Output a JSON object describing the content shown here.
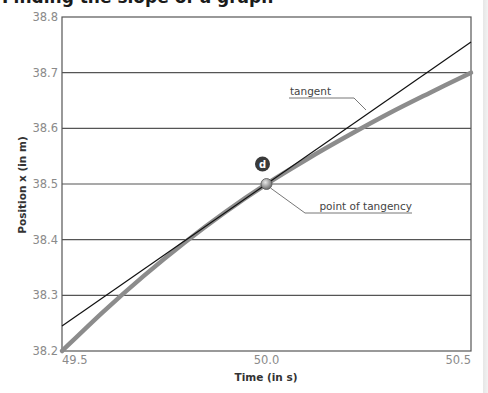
{
  "page": {
    "title": "Finding the slope of a graph"
  },
  "chart_data": {
    "type": "line",
    "title": "",
    "xlabel": "Time (in s)",
    "ylabel": "Position x (in m)",
    "xlim": [
      49.5,
      50.5
    ],
    "ylim": [
      38.2,
      38.8
    ],
    "xticks": [
      49.5,
      50.0,
      50.5
    ],
    "xtick_labels": [
      "49.5",
      "50.0",
      "50.5"
    ],
    "yticks": [
      38.2,
      38.3,
      38.4,
      38.5,
      38.6,
      38.7,
      38.8
    ],
    "ytick_labels": [
      "38.2",
      "38.3",
      "38.4",
      "38.5",
      "38.6",
      "38.7",
      "38.8"
    ],
    "grid": "horizontal",
    "series": [
      {
        "name": "position curve",
        "color": "#8c8c8c",
        "x": [
          49.5,
          49.6,
          49.7,
          49.8,
          49.9,
          50.0,
          50.1,
          50.2,
          50.3,
          50.4,
          50.5
        ],
        "y": [
          38.2,
          38.27,
          38.335,
          38.395,
          38.45,
          38.5,
          38.545,
          38.587,
          38.627,
          38.664,
          38.7
        ]
      },
      {
        "name": "tangent",
        "color": "#111111",
        "x": [
          49.5,
          50.5
        ],
        "y": [
          38.245,
          38.755
        ]
      }
    ],
    "point_of_tangency": {
      "x": 50.0,
      "y": 38.5,
      "marker_label": "d"
    },
    "annotations": [
      {
        "text": "tangent",
        "target": "tangent"
      },
      {
        "text": "point of tangency",
        "target": "point_of_tangency"
      }
    ]
  }
}
